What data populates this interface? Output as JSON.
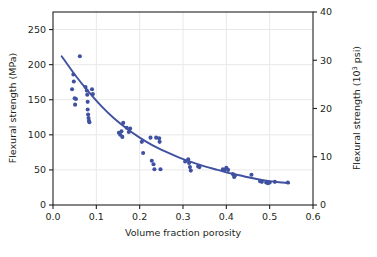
{
  "chart_data": {
    "type": "scatter",
    "title": "",
    "subtitle": "",
    "xlabel": "Volume fraction porosity",
    "ylabel": "Flexural strength (MPa)",
    "y2label_main": "Flexural strength (10",
    "y2label_sup": "3",
    "y2label_tail": " psi)",
    "y2label": "Flexural strength (10^3 psi)",
    "xlim": [
      0.0,
      0.6
    ],
    "ylim": [
      0,
      275
    ],
    "y2lim": [
      0,
      40
    ],
    "xticks": [
      "0.0",
      "0.1",
      "0.2",
      "0.3",
      "0.4",
      "0.5",
      "0.6"
    ],
    "xtick_values": [
      0.0,
      0.1,
      0.2,
      0.3,
      0.4,
      0.5,
      0.6
    ],
    "yticks": [
      "0",
      "50",
      "100",
      "150",
      "200",
      "250"
    ],
    "ytick_values": [
      0,
      50,
      100,
      150,
      200,
      250
    ],
    "y2ticks": [
      "0",
      "10",
      "20",
      "30",
      "40"
    ],
    "y2tick_values": [
      0,
      10,
      20,
      30,
      40
    ],
    "grid": true,
    "grid_color": "#e8e8e8",
    "legend": "none",
    "marker_color": "#3f51a0",
    "line_color": "#3f51a0",
    "axis_color": "#231f20",
    "background": "#ffffff",
    "series": [
      {
        "name": "Measured flexural strength",
        "type": "scatter",
        "points": [
          [
            0.044,
            165
          ],
          [
            0.047,
            186
          ],
          [
            0.048,
            176
          ],
          [
            0.05,
            152
          ],
          [
            0.051,
            143
          ],
          [
            0.053,
            151
          ],
          [
            0.062,
            212
          ],
          [
            0.075,
            168
          ],
          [
            0.078,
            163
          ],
          [
            0.079,
            157
          ],
          [
            0.08,
            147
          ],
          [
            0.08,
            136
          ],
          [
            0.081,
            129
          ],
          [
            0.082,
            124
          ],
          [
            0.083,
            120
          ],
          [
            0.084,
            118
          ],
          [
            0.09,
            165
          ],
          [
            0.092,
            158
          ],
          [
            0.152,
            103
          ],
          [
            0.155,
            100
          ],
          [
            0.158,
            105
          ],
          [
            0.16,
            97
          ],
          [
            0.162,
            117
          ],
          [
            0.17,
            110
          ],
          [
            0.175,
            104
          ],
          [
            0.178,
            109
          ],
          [
            0.205,
            90
          ],
          [
            0.208,
            74
          ],
          [
            0.225,
            96
          ],
          [
            0.228,
            63
          ],
          [
            0.232,
            58
          ],
          [
            0.234,
            51
          ],
          [
            0.238,
            96
          ],
          [
            0.245,
            95
          ],
          [
            0.246,
            90
          ],
          [
            0.248,
            51
          ],
          [
            0.305,
            62
          ],
          [
            0.312,
            65
          ],
          [
            0.314,
            60
          ],
          [
            0.316,
            54
          ],
          [
            0.318,
            49
          ],
          [
            0.335,
            55
          ],
          [
            0.338,
            54
          ],
          [
            0.392,
            51
          ],
          [
            0.396,
            50
          ],
          [
            0.4,
            53
          ],
          [
            0.404,
            50
          ],
          [
            0.415,
            44
          ],
          [
            0.418,
            40
          ],
          [
            0.42,
            42
          ],
          [
            0.458,
            43
          ],
          [
            0.478,
            34
          ],
          [
            0.482,
            33
          ],
          [
            0.492,
            32
          ],
          [
            0.496,
            31
          ],
          [
            0.5,
            32
          ],
          [
            0.512,
            33
          ],
          [
            0.542,
            32
          ]
        ]
      },
      {
        "name": "Fitted exponential curve",
        "type": "line",
        "points": [
          [
            0.02,
            212
          ],
          [
            0.05,
            186
          ],
          [
            0.08,
            163
          ],
          [
            0.11,
            142
          ],
          [
            0.14,
            124
          ],
          [
            0.17,
            109
          ],
          [
            0.2,
            96
          ],
          [
            0.23,
            85
          ],
          [
            0.26,
            76
          ],
          [
            0.29,
            68
          ],
          [
            0.32,
            61
          ],
          [
            0.35,
            55
          ],
          [
            0.38,
            50
          ],
          [
            0.41,
            45
          ],
          [
            0.44,
            41
          ],
          [
            0.47,
            37
          ],
          [
            0.5,
            34
          ],
          [
            0.53,
            32
          ],
          [
            0.545,
            31
          ]
        ]
      }
    ]
  },
  "axes": {
    "x_title": "Volume fraction porosity",
    "y_left_title": "Flexural strength (MPa)",
    "y_right_title_main": "Flexural strength (10",
    "y_right_title_sup": "3",
    "y_right_title_tail": " psi)"
  }
}
